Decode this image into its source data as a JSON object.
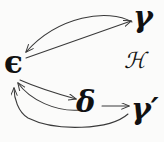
{
  "figure": {
    "kind": "commutative-diagram",
    "background_color": "#fbfbfa",
    "ink_color": "#3a3a3a",
    "text_color": "#111111",
    "width": 164,
    "height": 142
  },
  "nodes": {
    "epsilon": {
      "label": "ϵ",
      "name": "epsilon",
      "x": 14,
      "y": 63
    },
    "gamma": {
      "label": "γ",
      "name": "gamma",
      "x": 145,
      "y": 18
    },
    "delta": {
      "label": "δ",
      "name": "delta",
      "x": 86,
      "y": 104
    },
    "gamma_prime": {
      "label": "γ′",
      "name": "gamma-prime",
      "x": 145,
      "y": 110
    },
    "script_h": {
      "label": "ℋ",
      "name": "script-h",
      "x": 133,
      "y": 62
    }
  },
  "edges": [
    {
      "name": "gamma-to-epsilon",
      "from": "gamma",
      "to": "epsilon",
      "style": "curved",
      "path": "M132,22 C108,8 58,16 26,52",
      "arrowhead_at": "epsilon"
    },
    {
      "name": "epsilon-to-gamma",
      "from": "epsilon",
      "to": "gamma",
      "style": "straight",
      "path": "M26,58 L131,21",
      "arrowhead_at": "gamma"
    },
    {
      "name": "epsilon-to-delta",
      "from": "epsilon",
      "to": "delta",
      "style": "curved",
      "path": "M20,80 C38,88 58,94 76,99",
      "arrowhead_at": "delta"
    },
    {
      "name": "delta-to-epsilon",
      "from": "delta",
      "to": "epsilon",
      "style": "curved",
      "path": "M80,110 C56,112 30,100 18,83",
      "arrowhead_at": "epsilon"
    },
    {
      "name": "delta-to-gamma-prime",
      "from": "delta",
      "to": "gamma_prime",
      "style": "straight",
      "path": "M102,106 L129,106",
      "arrowhead_at": "gamma_prime"
    },
    {
      "name": "gamma-prime-to-epsilon",
      "from": "gamma_prime",
      "to": "epsilon",
      "style": "long-curve",
      "path": "M128,114 C110,130 56,132 28,118 C18,112 14,98 14,88",
      "arrowhead_at": "epsilon"
    }
  ]
}
